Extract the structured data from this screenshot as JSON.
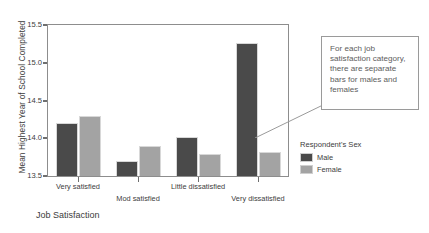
{
  "chart_data": {
    "type": "bar",
    "title": "",
    "xlabel": "Job Satisfaction",
    "ylabel": "Mean Highest Year of School Completed",
    "categories": [
      "Very satisfied",
      "Mod satisfied",
      "Little dissatisfied",
      "Very dissatisfied"
    ],
    "series": [
      {
        "name": "Male",
        "color": "#4a4a4a",
        "values": [
          14.2,
          13.7,
          14.02,
          15.26
        ]
      },
      {
        "name": "Female",
        "color": "#a3a3a3",
        "values": [
          14.3,
          13.9,
          13.79,
          13.82
        ]
      }
    ],
    "ylim": [
      13.5,
      15.5
    ],
    "yticks": [
      "13.5",
      "14.0",
      "14.5",
      "15.0",
      "15.5"
    ],
    "ytick_values": [
      13.5,
      14.0,
      14.5,
      15.0,
      15.5
    ],
    "grid": false,
    "legend_position": "right"
  },
  "legend": {
    "title": "Respondent's Sex",
    "entries": [
      {
        "label": "Male",
        "color": "#4a4a4a"
      },
      {
        "label": "Female",
        "color": "#a3a3a3"
      }
    ]
  },
  "callout": {
    "text": "For each job satisfaction category, there are separate bars for males and females"
  },
  "colors": {
    "male": "#4a4a4a",
    "female": "#a3a3a3",
    "axis": "#8d8d8d",
    "text": "#3c3c3c",
    "callout_text": "#5d5d5d",
    "callout_border": "#9a9a9a"
  }
}
